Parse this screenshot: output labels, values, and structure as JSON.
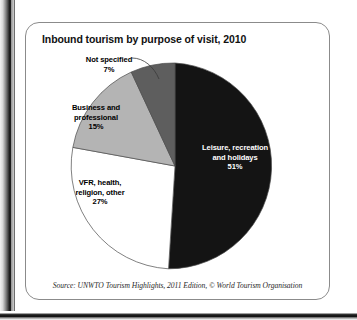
{
  "card": {
    "title": "Inbound tourism by purpose of visit, 2010",
    "source": "Source: UNWTO Tourism Highlights, 2011 Edition, © World Tourism Organisation"
  },
  "labels": {
    "not_specified": "Not specified\n7%",
    "business": "Business and\nprofessional\n15%",
    "vfr": "VFR, health,\nreligion, other\n27%",
    "leisure": "Leisure, recreation\nand holidays\n51%"
  },
  "colors": {
    "leisure": "#141414",
    "vfr": "#ffffff",
    "business": "#b4b4b4",
    "not_specified": "#5e5e5e",
    "slice_outline": "#4a4a4a",
    "card_border": "#8b8b8b",
    "leader_line": "#3a3a3a"
  },
  "chart_data": {
    "type": "pie",
    "title": "Inbound tourism by purpose of visit, 2010",
    "subtitle": "",
    "xlabel": "",
    "ylabel": "",
    "unit": "percent",
    "legend_position": "none",
    "labels_inline": true,
    "start_angle_deg": 0,
    "direction": "clockwise",
    "categories": [
      "Leisure, recreation and holidays",
      "VFR, health, religion, other",
      "Business and professional",
      "Not specified"
    ],
    "values": [
      51,
      27,
      15,
      7
    ],
    "slice_colors": [
      "#141414",
      "#ffffff",
      "#b4b4b4",
      "#5e5e5e"
    ],
    "annotations": [
      "Source: UNWTO Tourism Highlights, 2011 Edition, © World Tourism Organisation"
    ]
  }
}
